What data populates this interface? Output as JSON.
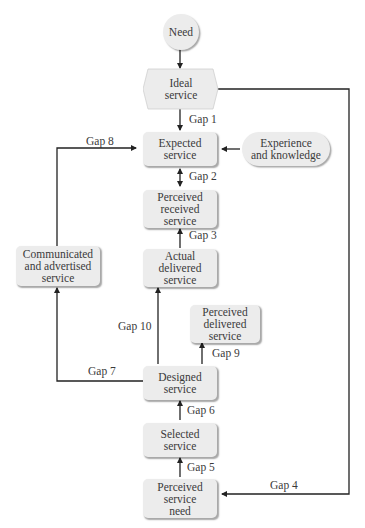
{
  "diagram": {
    "nodes": {
      "need": "Need",
      "ideal": "Ideal\nservice",
      "expected": "Expected\nservice",
      "experience": "Experience\nand knowledge",
      "perceived_received": "Perceived\nreceived\nservice",
      "communicated": "Communicated\nand advertised\nservice",
      "actual_delivered": "Actual\ndelivered\nservice",
      "perceived_delivered": "Perceived\ndelivered\nservice",
      "designed": "Designed\nservice",
      "selected": "Selected\nservice",
      "perceived_need": "Perceived\nservice\nneed"
    },
    "gaps": {
      "gap1": "Gap 1",
      "gap2": "Gap 2",
      "gap3": "Gap 3",
      "gap4": "Gap 4",
      "gap5": "Gap 5",
      "gap6": "Gap 6",
      "gap7": "Gap 7",
      "gap8": "Gap 8",
      "gap9": "Gap 9",
      "gap10": "Gap 10"
    },
    "colors": {
      "node_fill": "#ececec",
      "line": "#222222"
    }
  }
}
